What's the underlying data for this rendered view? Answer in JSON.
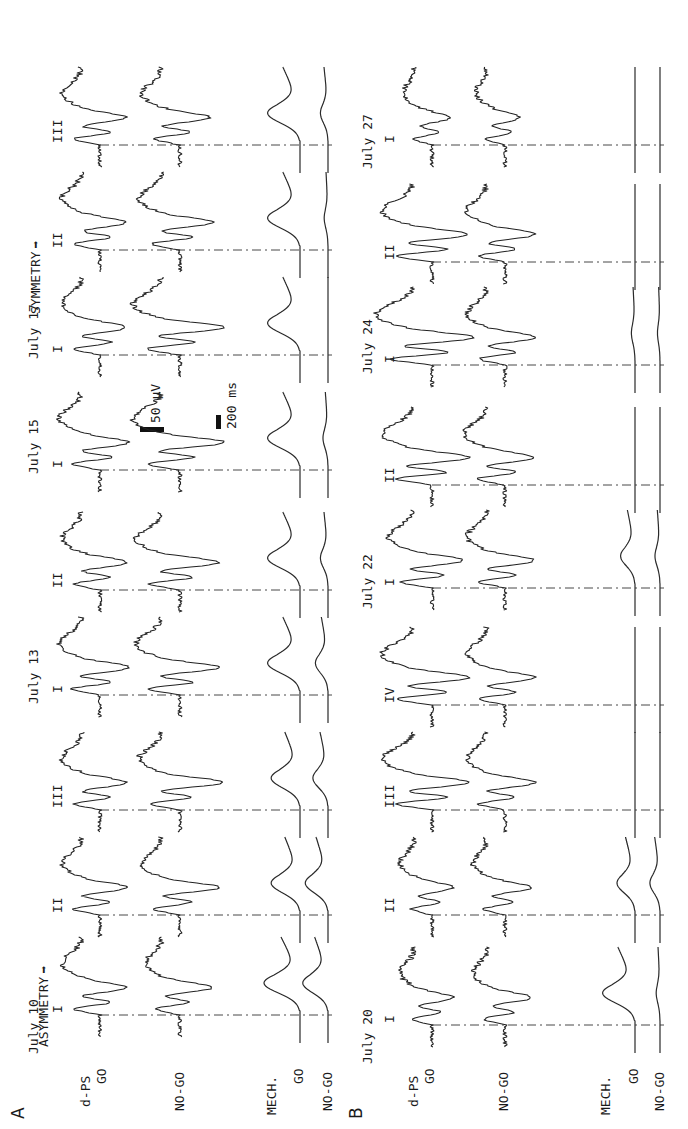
{
  "figure": {
    "panels": [
      {
        "id": "A",
        "label": "A",
        "condition_label": "ASYMMETRY",
        "condition_secondary_label": "SYMMETRY",
        "row_labels": {
          "dps": "d-PS",
          "go": "GO",
          "nogo": "NO-GO",
          "mech": "MECH.",
          "mech_go": "GO",
          "mech_nogo": "NO-GO"
        },
        "scale_bar": {
          "voltage": "50 µV",
          "time": "200 ms"
        }
      },
      {
        "id": "B",
        "label": "B",
        "row_labels": {
          "dps": "d-PS",
          "go": "GO",
          "nogo": "NO-GO",
          "mech": "MECH.",
          "mech_go": "GO",
          "mech_nogo": "NO-GO"
        }
      }
    ]
  },
  "chart_data": {
    "type": "line",
    "title": "",
    "scale": {
      "voltage_bar": "50 µV",
      "time_bar": "200 ms"
    },
    "panels": [
      {
        "panel": "A",
        "annotations": [
          "ASYMMETRY →",
          "SYMMETRY →"
        ],
        "series_rows": [
          "d-PS GO",
          "d-PS NO-GO",
          "MECH. GO",
          "MECH. NO-GO"
        ],
        "dates": [
          {
            "date": "July 10",
            "trials": [
              "I",
              "II",
              "III"
            ]
          },
          {
            "date": "July 13",
            "trials": [
              "I",
              "II"
            ]
          },
          {
            "date": "July 15",
            "trials": [
              "I"
            ]
          },
          {
            "date": "July 17",
            "trials": [
              "I",
              "II",
              "III"
            ]
          }
        ],
        "trials": [
          {
            "date": "July 10",
            "trial": "I",
            "trig": 114,
            "go_amp": 1.0,
            "nogo_amp": 0.9,
            "nogo_dip": 1.1,
            "mech_go": 1.0,
            "mech_nogo": 1.0
          },
          {
            "date": "July 10",
            "trial": "II",
            "trig": 214,
            "go_amp": 1.0,
            "nogo_amp": 1.0,
            "nogo_dip": 1.3,
            "mech_go": 0.8,
            "mech_nogo": 0.9
          },
          {
            "date": "July 10",
            "trial": "III",
            "trig": 319,
            "go_amp": 1.0,
            "nogo_amp": 1.1,
            "nogo_dip": 1.4,
            "mech_go": 0.8,
            "mech_nogo": 0.6
          },
          {
            "date": "July 13",
            "trial": "I",
            "trig": 434,
            "go_amp": 1.1,
            "nogo_amp": 1.2,
            "nogo_dip": 1.3,
            "mech_go": 0.9,
            "mech_nogo": 0.5
          },
          {
            "date": "July 13",
            "trial": "II",
            "trig": 539,
            "go_amp": 1.0,
            "nogo_amp": 1.2,
            "nogo_dip": 1.3,
            "mech_go": 0.9,
            "mech_nogo": 0.3
          },
          {
            "date": "July 15",
            "trial": "I",
            "trig": 659,
            "go_amp": 1.1,
            "nogo_amp": 1.3,
            "nogo_dip": 1.5,
            "mech_go": 0.9,
            "mech_nogo": 0.2
          },
          {
            "date": "July 17",
            "trial": "I",
            "trig": 774,
            "go_amp": 1.0,
            "nogo_amp": 1.3,
            "nogo_dip": 1.5,
            "mech_go": 0.9,
            "mech_nogo": 0.0
          },
          {
            "date": "July 17",
            "trial": "II",
            "trig": 879,
            "go_amp": 1.0,
            "nogo_amp": 1.1,
            "nogo_dip": 1.1,
            "mech_go": 0.9,
            "mech_nogo": 0.15
          },
          {
            "date": "July 17",
            "trial": "III",
            "trig": 984,
            "go_amp": 1.0,
            "nogo_amp": 1.0,
            "nogo_dip": 1.0,
            "mech_go": 0.9,
            "mech_nogo": 0.3
          }
        ]
      },
      {
        "panel": "B",
        "series_rows": [
          "d-PS GO",
          "d-PS NO-GO",
          "MECH. GO",
          "MECH. NO-GO"
        ],
        "dates": [
          {
            "date": "July 20",
            "trials": [
              "I",
              "II",
              "III"
            ]
          },
          {
            "date": "July 22",
            "trials": [
              "IV",
              "I",
              "II"
            ]
          },
          {
            "date": "July 24",
            "trials": [
              "I",
              "II"
            ]
          },
          {
            "date": "July 27",
            "trials": [
              "I"
            ]
          }
        ],
        "trials": [
          {
            "date": "July 20",
            "trial": "I",
            "trig": 104,
            "go_amp": 0.8,
            "nogo_amp": 0.8,
            "nogo_dip": 0.9,
            "mech_go": 0.9,
            "mech_nogo": 0.15
          },
          {
            "date": "July 20",
            "trial": "II",
            "trig": 214,
            "go_amp": 0.8,
            "nogo_amp": 0.8,
            "nogo_dip": 0.9,
            "mech_go": 0.5,
            "mech_nogo": 0.4
          },
          {
            "date": "July 20",
            "trial": "III",
            "trig": 319,
            "go_amp": 1.4,
            "nogo_amp": 1.0,
            "nogo_dip": 1.0,
            "mech_go": 0.0,
            "mech_nogo": 0.0
          },
          {
            "date": "July 22",
            "trial": "IV",
            "trig": 424,
            "go_amp": 1.4,
            "nogo_amp": 1.0,
            "nogo_dip": 1.0,
            "mech_go": 0.0,
            "mech_nogo": 0.0
          },
          {
            "date": "July 22",
            "trial": "I",
            "trig": 541,
            "go_amp": 1.2,
            "nogo_amp": 1.0,
            "nogo_dip": 1.0,
            "mech_go": 0.4,
            "mech_nogo": 0.2
          },
          {
            "date": "July 22",
            "trial": "II",
            "trig": 644,
            "go_amp": 1.4,
            "nogo_amp": 1.1,
            "nogo_dip": 1.0,
            "mech_go": 0.0,
            "mech_nogo": 0.0
          },
          {
            "date": "July 24",
            "trial": "I",
            "trig": 764,
            "go_amp": 1.6,
            "nogo_amp": 1.0,
            "nogo_dip": 1.0,
            "mech_go": 0.1,
            "mech_nogo": 0.1
          },
          {
            "date": "July 24",
            "trial": "II",
            "trig": 867,
            "go_amp": 1.4,
            "nogo_amp": 1.0,
            "nogo_dip": 1.0,
            "mech_go": 0.0,
            "mech_nogo": 0.0
          },
          {
            "date": "July 27",
            "trial": "I",
            "trig": 984,
            "go_amp": 0.7,
            "nogo_amp": 0.7,
            "nogo_dip": 0.5,
            "mech_go": 0.0,
            "mech_nogo": 0.0
          }
        ]
      }
    ],
    "date_labels": {
      "A": [
        {
          "text": "July 10",
          "u": 75
        },
        {
          "text": "July 13",
          "u": 425
        },
        {
          "text": "July 15",
          "u": 655
        },
        {
          "text": "July 17",
          "u": 770
        }
      ],
      "B": [
        {
          "text": "July 20",
          "u": 65
        },
        {
          "text": "July 22",
          "u": 520
        },
        {
          "text": "July 24",
          "u": 755
        },
        {
          "text": "July 27",
          "u": 960
        }
      ]
    }
  }
}
